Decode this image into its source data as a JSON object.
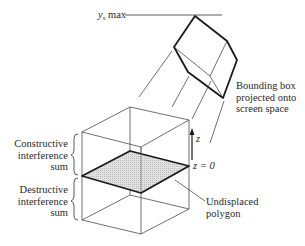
{
  "labels": {
    "ys_max": {
      "var": "y",
      "sub": "s",
      "rest": " max"
    },
    "bounding_box": [
      "Bounding box",
      "projected onto",
      "screen space"
    ],
    "z_axis": "z",
    "z_zero": "z = 0",
    "constructive": [
      "Constructive",
      "interference",
      "sum"
    ],
    "destructive": [
      "Destructive",
      "interference",
      "sum"
    ],
    "undisplaced": [
      "Undisplaced",
      "polygon"
    ]
  },
  "colors": {
    "line": "#333333",
    "thick_line": "#1a1a1a",
    "polygon_fill": "#d9d9d9",
    "background": "#ffffff"
  }
}
